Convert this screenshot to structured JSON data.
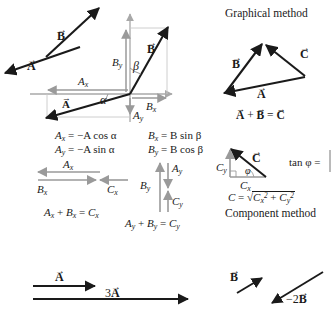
{
  "figure": {
    "colors": {
      "vector_black": "#1a1a1a",
      "component_gray": "#9a9a9a",
      "axis_gray": "#a8a8a8",
      "guide_gray": "#c0c0c0",
      "background": "#ffffff"
    }
  },
  "panel_vectors": {
    "label_A_free": "A",
    "label_B_free": "B"
  },
  "panel_axes": {
    "label_B_vector": "B",
    "label_A_vector": "A",
    "label_Bx": "B",
    "label_Bx_sub": "x",
    "label_By": "B",
    "label_By_sub": "y",
    "label_Ax": "A",
    "label_Ax_sub": "x",
    "label_Ay": "A",
    "label_Ay_sub": "y",
    "angle_alpha": "α",
    "angle_beta": "β"
  },
  "equations_components": {
    "ax": "A",
    "ax_sub": "x",
    "ax_rhs": "= −A cos α",
    "ay": "A",
    "ay_sub": "y",
    "ay_rhs": "= −A sin α",
    "bx": "B",
    "bx_sub": "x",
    "bx_rhs": "= B sin β",
    "by": "B",
    "by_sub": "y",
    "by_rhs": "= B cos β"
  },
  "panel_component_sum_x": {
    "label_Ax": "A",
    "label_Ax_sub": "x",
    "label_Bx": "B",
    "label_Bx_sub": "x",
    "label_Cx": "C",
    "label_Cx_sub": "x",
    "equation": "A",
    "equation_full": "Aₓ + Bₓ = Cₓ"
  },
  "panel_component_sum_y": {
    "label_Ay": "A",
    "label_Ay_sub": "y",
    "label_By": "B",
    "label_By_sub": "y",
    "label_Cy": "C",
    "label_Cy_sub": "y"
  },
  "panel_graphical": {
    "heading": "Graphical method",
    "label_A": "A",
    "label_B": "B",
    "label_C": "C",
    "equation": "A + B = C"
  },
  "panel_component_method": {
    "heading": "Component method",
    "label_C": "C",
    "label_Cx": "C",
    "label_Cx_sub": "x",
    "label_Cy": "C",
    "label_Cy_sub": "y",
    "angle_phi": "φ",
    "tan_formula": "tan φ =",
    "magnitude_lhs": "C =",
    "magnitude_rhs": "Cₓ² + Cᵧ²"
  },
  "panel_scalar": {
    "label_A": "A",
    "label_3A": "3",
    "label_3A_vec": "A",
    "label_B": "B",
    "label_minus2B": "−2",
    "label_minus2B_vec": "B"
  }
}
